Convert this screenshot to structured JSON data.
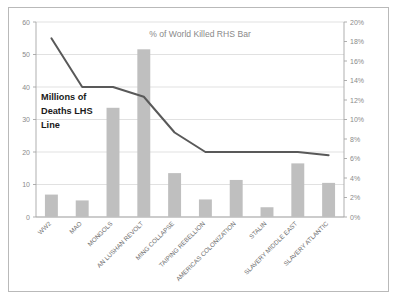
{
  "chart_data": {
    "type": "bar",
    "title": "% of World Killed RHS Bar",
    "annotation": "Millions of Deaths LHS Line",
    "annotation_lines": [
      "Millions of",
      "Deaths LHS",
      "Line"
    ],
    "categories": [
      "WW2",
      "MAO",
      "MONGOLS",
      "AN LUSHAN REVOLT",
      "MING COLLAPSE",
      "TAIPING REBELLION",
      "AMERICAS COLONIZATION",
      "STALIN",
      "SLAVERY MIDDLE EAST",
      "SLAVERY ATLANTIC"
    ],
    "series": [
      {
        "name": "% of World Killed RHS Bar",
        "type": "bar",
        "axis": "right",
        "unit": "%",
        "color": "#bfbfbf",
        "values": [
          2.3,
          1.7,
          11.2,
          17.2,
          4.5,
          1.8,
          3.8,
          1.0,
          5.5,
          3.5
        ]
      },
      {
        "name": "Millions of Deaths LHS Line",
        "type": "line",
        "axis": "left",
        "unit": "millions",
        "color": "#595959",
        "values": [
          55,
          40,
          40,
          37,
          26,
          20,
          20,
          20,
          20,
          19
        ]
      }
    ],
    "left_axis": {
      "label": "Millions of Deaths",
      "min": 0,
      "max": 60,
      "step": 10,
      "ticks": [
        "0",
        "10",
        "20",
        "30",
        "40",
        "50",
        "60"
      ]
    },
    "right_axis": {
      "label": "% of World Killed",
      "min": 0,
      "max": 20,
      "step": 2,
      "ticks": [
        "0%",
        "2%",
        "4%",
        "6%",
        "8%",
        "10%",
        "12%",
        "14%",
        "16%",
        "18%",
        "20%"
      ]
    },
    "xlabel": "",
    "grid": true,
    "legend": "none",
    "colors": {
      "bar": "#bfbfbf",
      "line": "#595959",
      "grid": "#d9d9d9",
      "axis": "#a6a6a6",
      "tick_text": "#8a8a8a",
      "title_text": "#8a8a8a",
      "annotation_text": "#1a1a1a",
      "border": "#b9b9b9",
      "background": "#ffffff"
    }
  }
}
